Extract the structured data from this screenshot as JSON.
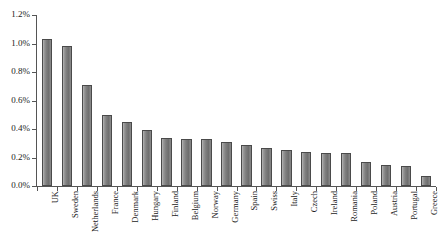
{
  "chart_data": {
    "type": "bar",
    "title": "",
    "subtitle": "",
    "xlabel": "",
    "ylabel": "",
    "ylim": [
      0,
      1.2
    ],
    "yunit": "%",
    "grid": false,
    "legend": false,
    "legend_position": "none",
    "orientation": "vertical",
    "sorted": "descending",
    "bar_color": "#808080",
    "axis_color": "#555555",
    "background_color": "#ffffff",
    "ytick_labels": [
      "1.2%",
      "1.0%",
      "0.8%",
      "0.6%",
      "0.4%",
      "0.2%",
      "0.0%"
    ],
    "ytick_values": [
      1.2,
      1.0,
      0.8,
      0.6,
      0.4,
      0.2,
      0.0
    ],
    "categories": [
      "UK",
      "Sweden",
      "Netherlands",
      "France",
      "Denmark",
      "Hungary",
      "Finland",
      "Belgium",
      "Norway",
      "Germany",
      "Spain",
      "Swiss",
      "Italy",
      "Czech",
      "Ireland",
      "Romania",
      "Poland",
      "Austria",
      "Portugal",
      "Greece"
    ],
    "values": [
      1.03,
      0.98,
      0.71,
      0.5,
      0.45,
      0.39,
      0.34,
      0.33,
      0.33,
      0.31,
      0.29,
      0.27,
      0.25,
      0.24,
      0.23,
      0.23,
      0.17,
      0.15,
      0.14,
      0.07
    ]
  }
}
